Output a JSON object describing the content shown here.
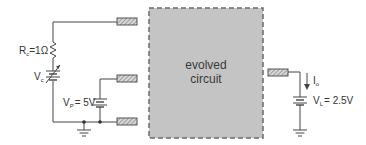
{
  "diagram": {
    "block": {
      "line1": "evolved",
      "line2": "circuit",
      "fill": "#c4c4c4",
      "border": "#6a6a6a"
    },
    "labels": {
      "rc_main": "R",
      "rc_sub": "c",
      "rc_value": "=1Ω",
      "vc_main": "V",
      "vc_sub": "c",
      "vp_main": "V",
      "vp_sub": "P",
      "vp_value": "= 5V",
      "io_main": "I",
      "io_sub": "o",
      "vl_main": "V",
      "vl_sub": "L",
      "vl_value": "= 2.5V"
    },
    "components": [
      {
        "type": "resistor",
        "name": "Rc",
        "value": "1Ω"
      },
      {
        "type": "variable-voltage-source",
        "name": "Vc"
      },
      {
        "type": "voltage-source",
        "name": "Vp",
        "value": "5V"
      },
      {
        "type": "voltage-source",
        "name": "VL",
        "value": "2.5V"
      },
      {
        "type": "current-arrow",
        "name": "Io"
      },
      {
        "type": "ground",
        "count": 2
      },
      {
        "type": "terminal-pad",
        "count": 4
      }
    ],
    "colors": {
      "wire": "#444444",
      "pad_fill": "#d0d0d0",
      "pad_hatch": "#777777"
    }
  }
}
